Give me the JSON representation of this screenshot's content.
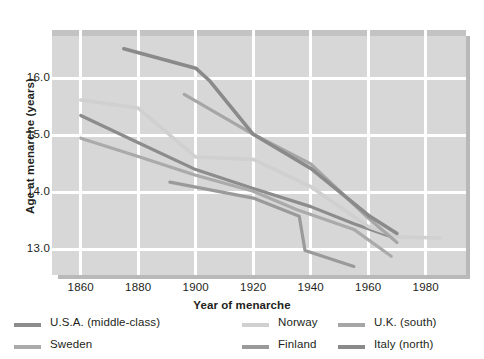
{
  "chart_data": {
    "type": "line",
    "title": "",
    "xlabel": "Year of menarche",
    "ylabel": "Age at menarche (years)",
    "xlim": [
      1850,
      1994
    ],
    "ylim": [
      12.55,
      16.85
    ],
    "xticks": [
      1860,
      1880,
      1900,
      1920,
      1940,
      1960,
      1980
    ],
    "yticks": [
      13.0,
      14.0,
      15.0,
      16.0
    ],
    "xticklabels": [
      "1860",
      "1880",
      "1900",
      "1920",
      "1940",
      "1960",
      "1980"
    ],
    "yticklabels": [
      "13.0",
      "14.0",
      "15.0",
      "16.0"
    ],
    "grid": true,
    "grid_color": "#ffffff",
    "plot_background": "#d7d7d7",
    "legend_position": "below",
    "series": [
      {
        "name": "U.S.A. (middle-class)",
        "color": "#8c8c8c",
        "linewidth": 3.2,
        "points": [
          [
            1860,
            15.35
          ],
          [
            1878,
            14.92
          ],
          [
            1900,
            14.4
          ],
          [
            1920,
            14.07
          ],
          [
            1940,
            13.75
          ],
          [
            1955,
            13.45
          ],
          [
            1968,
            13.22
          ]
        ]
      },
      {
        "name": "Sweden",
        "color": "#aaaaaa",
        "linewidth": 3.2,
        "points": [
          [
            1860,
            14.95
          ],
          [
            1880,
            14.63
          ],
          [
            1900,
            14.3
          ],
          [
            1920,
            14.02
          ],
          [
            1935,
            13.7
          ],
          [
            1955,
            13.35
          ],
          [
            1968,
            12.88
          ]
        ]
      },
      {
        "name": "Norway",
        "color": "#d0d0d0",
        "linewidth": 3.6,
        "points": [
          [
            1860,
            15.62
          ],
          [
            1880,
            15.48
          ],
          [
            1900,
            14.62
          ],
          [
            1920,
            14.58
          ],
          [
            1940,
            14.1
          ],
          [
            1960,
            13.4
          ],
          [
            1970,
            13.22
          ],
          [
            1985,
            13.2
          ]
        ]
      },
      {
        "name": "Finland",
        "color": "#9a9a9a",
        "linewidth": 3.2,
        "points": [
          [
            1891,
            14.18
          ],
          [
            1920,
            13.9
          ],
          [
            1936,
            13.58
          ],
          [
            1938,
            12.98
          ],
          [
            1955,
            12.7
          ]
        ]
      },
      {
        "name": "U.K. (south)",
        "color": "#a6a6a6",
        "linewidth": 3.2,
        "points": [
          [
            1896,
            15.72
          ],
          [
            1920,
            15.02
          ],
          [
            1940,
            14.5
          ],
          [
            1960,
            13.55
          ],
          [
            1970,
            13.12
          ]
        ]
      },
      {
        "name": "Italy (north)",
        "color": "#8a8a8a",
        "linewidth": 3.6,
        "points": [
          [
            1875,
            16.52
          ],
          [
            1900,
            16.18
          ],
          [
            1905,
            15.95
          ],
          [
            1920,
            15.02
          ],
          [
            1940,
            14.42
          ],
          [
            1960,
            13.6
          ],
          [
            1970,
            13.28
          ]
        ]
      }
    ],
    "annotations": []
  },
  "legend": {
    "entries": [
      {
        "label": "U.S.A. (middle-class)",
        "color": "#8c8c8c"
      },
      {
        "label": "Norway",
        "color": "#d0d0d0"
      },
      {
        "label": "U.K. (south)",
        "color": "#a6a6a6"
      },
      {
        "label": "Sweden",
        "color": "#aaaaaa"
      },
      {
        "label": "Finland",
        "color": "#9a9a9a"
      },
      {
        "label": "Italy (north)",
        "color": "#8a8a8a"
      }
    ]
  }
}
